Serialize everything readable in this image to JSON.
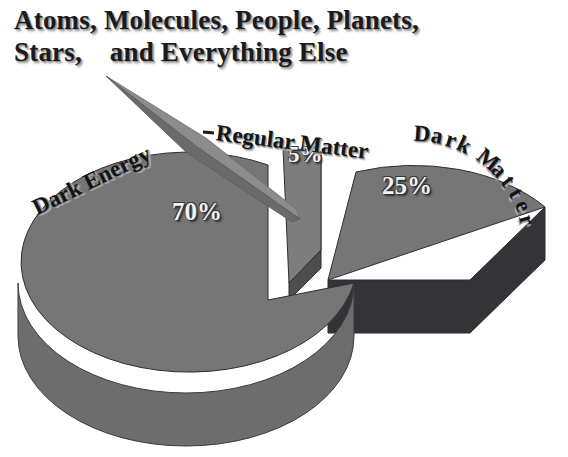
{
  "page": {
    "background_color": "#ffffff",
    "width": 568,
    "height": 457
  },
  "title": {
    "line1": "Atoms, Molecules, People, Planets,",
    "line2": "Stars,    and Everything Else",
    "color": "#1b1b1b"
  },
  "pointer": {
    "name": "callout-arrow",
    "from_label": "Stars,",
    "to_slice": "Regular Matter",
    "dash_mark": "-"
  },
  "labels": {
    "dark_energy": "Dark Energy",
    "regular_matter": "Regular Matter",
    "dark_matter": "Dark Matter"
  },
  "percent_labels": {
    "dark_energy": "70%",
    "regular_matter": "5%",
    "dark_matter": "25%"
  },
  "colors": {
    "slice_top": "#767676",
    "dark_energy_side": "#6d6d6d",
    "dark_matter_side": "#343438",
    "regular_matter_light": "#7d7d7d",
    "regular_matter_dark": "#5e5e5e",
    "arrow_light": "#8a8a8a",
    "arrow_dark": "#6a6a6a",
    "outline": "#2b2b2b"
  },
  "chart_data": {
    "type": "pie",
    "title": "Atoms, Molecules, People, Planets, Stars, and Everything Else",
    "subtitle": "",
    "xlabel": "",
    "ylabel": "",
    "exploded": true,
    "three_d": true,
    "legend_position": "none",
    "grid": false,
    "categories": [
      "Dark Energy",
      "Dark Matter",
      "Regular Matter"
    ],
    "values": [
      70,
      25,
      5
    ],
    "value_labels": [
      "70%",
      "25%",
      "5%"
    ],
    "slices": [
      {
        "label": "Dark Energy",
        "value": 70,
        "value_label": "70%",
        "color": "#767676",
        "side_color": "#6d6d6d",
        "exploded": false
      },
      {
        "label": "Dark Matter",
        "value": 25,
        "value_label": "25%",
        "color": "#767676",
        "side_color": "#343438",
        "exploded": true
      },
      {
        "label": "Regular Matter",
        "value": 5,
        "value_label": "5%",
        "color": "#7d7d7d",
        "side_color": "#5e5e5e",
        "exploded": true
      }
    ],
    "annotations": [
      {
        "text": "-",
        "target": "Regular Matter",
        "type": "leader-dash"
      }
    ]
  }
}
